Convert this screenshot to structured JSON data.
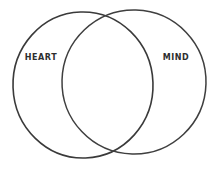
{
  "diagram": {
    "type": "venn",
    "title": "",
    "background_color": "#ffffff",
    "stroke_color": "#3a3a3a",
    "label_color": "#2e2e2e",
    "circles": [
      {
        "id": "left",
        "label": "HEART"
      },
      {
        "id": "right",
        "label": "MIND"
      }
    ]
  }
}
